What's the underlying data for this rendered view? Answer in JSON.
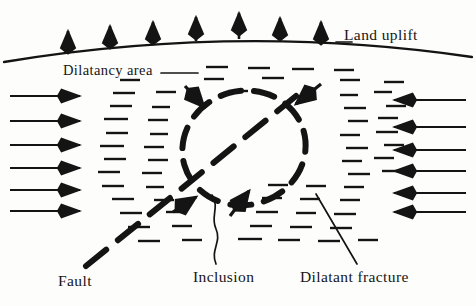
{
  "figure": {
    "background_color": "#fdfdfb",
    "ink_color": "#141414"
  },
  "labels": {
    "land_uplift": "Land uplift",
    "dilatancy_area": "Dilatancy area",
    "fault": "Fault",
    "inclusion": "Inclusion",
    "dilatant_fracture": "Dilatant fracture"
  },
  "elements": {
    "ground_surface": {
      "name": "ground-surface-arc",
      "description": "Curved land surface line bulging upward",
      "path": "M 4 61 Q 240 24 472 58"
    },
    "uplift_arrows": {
      "name": "uplift-arrow-group",
      "count": 7,
      "direction": "up",
      "x_positions": [
        68,
        110,
        153,
        196,
        238,
        279,
        320
      ],
      "base_y": [
        52,
        47,
        43,
        40,
        38,
        40,
        43
      ],
      "length": 22
    },
    "left_compression_arrows": {
      "name": "left-compression-arrow-group",
      "count": 6,
      "direction": "right",
      "x_start": 8,
      "x_end": 84,
      "y_positions": [
        96,
        121,
        145,
        168,
        190,
        211
      ]
    },
    "right_compression_arrows": {
      "name": "right-compression-arrow-group",
      "count": 6,
      "direction": "left",
      "x_start": 468,
      "x_end": 388,
      "y_positions": [
        100,
        127,
        150,
        171,
        193,
        212
      ]
    },
    "inclusion_ellipse": {
      "name": "inclusion-ellipse",
      "center_x": 244,
      "center_y": 148,
      "radius_x": 62,
      "radius_y": 56,
      "rotation_deg": -16,
      "stroke_style": "thick-dashed"
    },
    "fault_line": {
      "name": "fault-line",
      "description": "Thick dashed diagonal fault cutting through the inclusion",
      "x1": 88,
      "y1": 262,
      "x2": 290,
      "y2": 100
    },
    "convergence_arrows": {
      "name": "convergence-arrow-group",
      "count": 4,
      "description": "Short arrows pointing inward toward the inclusion boundary",
      "items": [
        {
          "x1": 186,
          "y1": 88,
          "x2": 205,
          "y2": 108
        },
        {
          "x1": 318,
          "y1": 86,
          "x2": 294,
          "y2": 105
        },
        {
          "x1": 232,
          "y1": 213,
          "x2": 248,
          "y2": 192
        },
        {
          "x1": 176,
          "y1": 210,
          "x2": 196,
          "y2": 196
        }
      ]
    },
    "dilatant_fracture_field": {
      "name": "dilatant-fracture-hatch-field",
      "description": "Field of short horizontal dashes representing dilatant cracks",
      "dash_length_range": [
        12,
        26
      ]
    },
    "leaders": {
      "dilatancy_leader": {
        "name": "dilatancy-leader-line",
        "x1": 163,
        "y1": 72,
        "x2": 196,
        "y2": 72
      },
      "inclusion_leader": {
        "name": "inclusion-leader-wavy-line",
        "style": "wavy",
        "x1": 218,
        "y1": 265,
        "x2": 212,
        "y2": 196
      },
      "dilatant_fracture_leader": {
        "name": "dilatant-fracture-leader-line",
        "x1": 355,
        "y1": 262,
        "x2": 318,
        "y2": 196
      }
    }
  }
}
